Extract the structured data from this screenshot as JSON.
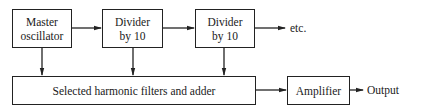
{
  "diagram": {
    "type": "block-diagram",
    "blocks": [
      {
        "id": "master",
        "line1": "Master",
        "line2": "oscillator"
      },
      {
        "id": "div1",
        "line1": "Divider",
        "line2": "by 10"
      },
      {
        "id": "div2",
        "line1": "Divider",
        "line2": "by 10"
      },
      {
        "id": "filters",
        "label": "Selected harmonic filters and adder"
      },
      {
        "id": "amp",
        "label": "Amplifier"
      }
    ],
    "terminals": {
      "etc": "etc.",
      "output": "Output"
    },
    "connections": [
      {
        "from": "master",
        "to": "div1"
      },
      {
        "from": "div1",
        "to": "div2"
      },
      {
        "from": "div2",
        "to": "etc."
      },
      {
        "from": "master",
        "to": "filters"
      },
      {
        "from": "div1",
        "to": "filters"
      },
      {
        "from": "div2",
        "to": "filters"
      },
      {
        "from": "filters",
        "to": "amp"
      },
      {
        "from": "amp",
        "to": "Output"
      }
    ],
    "colors": {
      "line": "#222222",
      "background": "#ffffff"
    }
  }
}
